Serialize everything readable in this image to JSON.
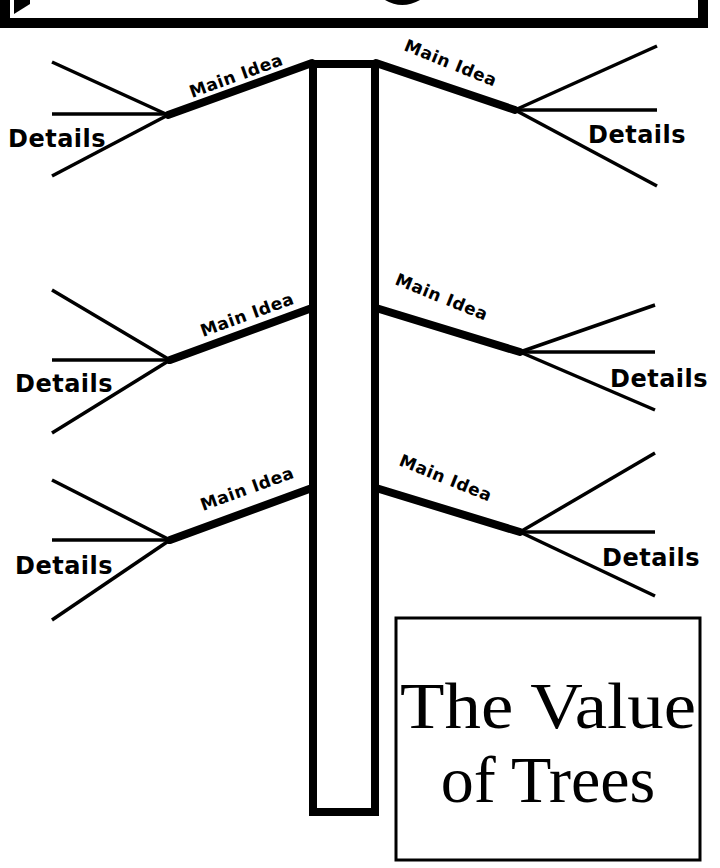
{
  "diagram": {
    "type": "tree-graphic-organizer",
    "colors": {
      "ink": "#000000",
      "paper": "#ffffff"
    },
    "title": {
      "line1": "The Value",
      "line2": "of Trees"
    },
    "branches": [
      {
        "side": "left",
        "position": "top",
        "main_label": "Main Idea",
        "details_label": "Details"
      },
      {
        "side": "right",
        "position": "top",
        "main_label": "Main Idea",
        "details_label": "Details"
      },
      {
        "side": "left",
        "position": "middle",
        "main_label": "Main Idea",
        "details_label": "Details"
      },
      {
        "side": "right",
        "position": "middle",
        "main_label": "Main Idea",
        "details_label": "Details"
      },
      {
        "side": "left",
        "position": "bottom",
        "main_label": "Main Idea",
        "details_label": "Details"
      },
      {
        "side": "right",
        "position": "bottom",
        "main_label": "Main Idea",
        "details_label": "Details"
      }
    ]
  }
}
